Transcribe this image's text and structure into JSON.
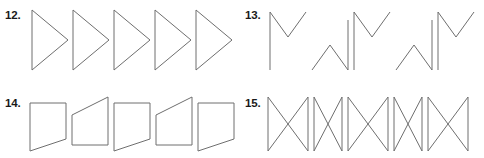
{
  "page": {
    "background_color": "#ffffff",
    "stroke_color": "#6e6e6e",
    "text_color": "#1a1a1a",
    "width": 484,
    "height": 158
  },
  "panels": [
    {
      "id": "panel-12",
      "number_label": "12.",
      "description": "Row of five arrow-head / triangle figures with a vertical left edge and a point on the right",
      "figure_count": 5,
      "figure_name": "triangle-arrowhead",
      "viewbox": "0 0 212 68",
      "shapes": [
        "M 8,4 L 8,64 L 8,64 L 44,34 Z",
        "M 49,4 L 49,64 L 85,34 Z",
        "M 90,4 L 90,64 L 126,34 Z",
        "M 131,4 L 131,64 L 167,34 Z",
        "M 172,4 L 172,64 L 208,34 Z"
      ]
    },
    {
      "id": "panel-13",
      "number_label": "13.",
      "description": "Row of five M-shaped zigzag figures alternating between a raised M and a lowered inverted M",
      "figure_count": 5,
      "figure_name": "m-zigzag",
      "viewbox": "0 0 214 74",
      "shapes": [
        "M 6,66 L 6,8 L 24,33 L 42,8",
        "M 48,66 L 66,41 L 84,66 L 84,16",
        "M 90,66 L 90,8 L 108,33 L 126,8",
        "M 132,66 L 150,41 L 168,66 L 168,16",
        "M 174,66 L 174,8 L 192,33 L 210,8"
      ]
    },
    {
      "id": "panel-14",
      "number_label": "14.",
      "description": "Row of five quadrilaterals alternating between flat-top/slanted-bottom and slanted-top/flat-bottom",
      "figure_count": 5,
      "figure_name": "slanted-quadrilateral",
      "viewbox": "0 0 212 62",
      "shapes": [
        "M 6,10 L 42,10 L 42,46 L 6,58 Z",
        "M 48,22 L 84,4 L 84,52 L 48,52 Z",
        "M 90,10 L 126,10 L 126,46 L 90,58 Z",
        "M 132,22 L 168,4 L 168,52 L 132,52 Z",
        "M 174,10 L 210,10 L 210,46 L 174,58 Z"
      ]
    },
    {
      "id": "panel-15",
      "number_label": "15.",
      "description": "Row of five bowtie / hourglass figures alternating between wide and narrow widths",
      "figure_count": 5,
      "figure_name": "bowtie-hourglass",
      "viewbox": "0 0 214 62",
      "shapes": [
        "M 4,4 L 4,58 L 44,4 L 44,58 Z",
        "M 50,4 L 50,58 L 78,4 L 78,58 Z",
        "M 84,4 L 84,58 L 124,4 L 124,58 Z",
        "M 130,4 L 130,58 L 158,4 L 158,58 Z",
        "M 164,4 L 164,58 L 204,4 L 204,58 Z"
      ]
    }
  ]
}
